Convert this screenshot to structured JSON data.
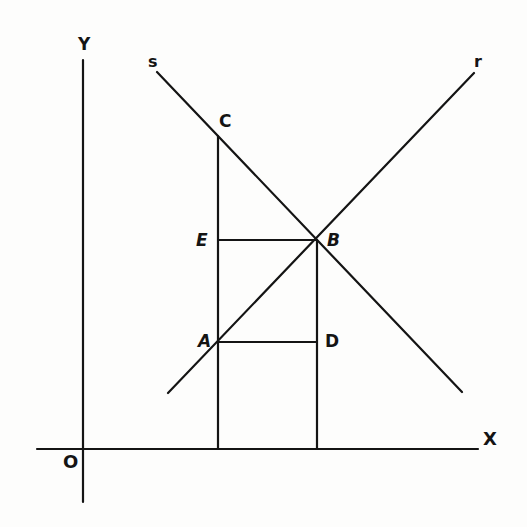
{
  "diagram": {
    "type": "geometry-figure",
    "axes": {
      "x_label": "X",
      "y_label": "Y",
      "origin_label": "O"
    },
    "lines": [
      {
        "name": "s",
        "label": "s"
      },
      {
        "name": "r",
        "label": "r"
      }
    ],
    "points": {
      "A": "A",
      "B": "B",
      "C": "C",
      "D": "D",
      "E": "E"
    },
    "colors": {
      "ink": "#141414",
      "paper": "#fdfdfc"
    }
  }
}
